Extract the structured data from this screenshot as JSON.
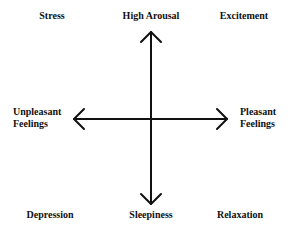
{
  "diagram": {
    "type": "circumplex model of affect",
    "colors": {
      "line": "#111111",
      "text": "#111111",
      "background": "#ffffff"
    },
    "corners": {
      "top_left": "Stress",
      "top_right": "Excitement",
      "bottom_left": "Depression",
      "bottom_right": "Relaxation"
    },
    "axes": {
      "vertical": {
        "top": "High Arousal",
        "bottom": "Sleepiness"
      },
      "horizontal": {
        "left_line1": "Unpleasant",
        "left_line2": "Feelings",
        "right_line1": "Pleasant",
        "right_line2": "Feelings"
      }
    }
  }
}
